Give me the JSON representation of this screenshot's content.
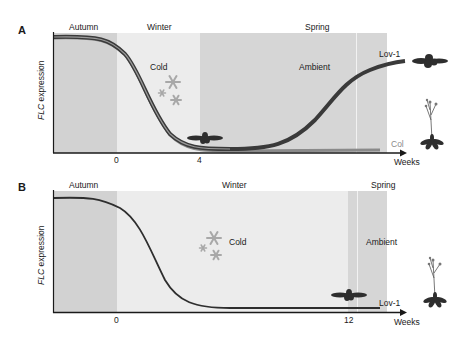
{
  "panels": [
    {
      "letter": "A",
      "ylabel_italic": "FLC",
      "ylabel_rest": " expression",
      "xlabel": "Weeks",
      "season_labels": {
        "autumn": "Autumn",
        "winter": "Winter",
        "spring": "Spring"
      },
      "condition_labels": {
        "cold": "Cold",
        "ambient": "Ambient"
      },
      "x_ticks": [
        "0",
        "4"
      ],
      "series_labels": {
        "lov1": "Lov-1",
        "col": "Col"
      }
    },
    {
      "letter": "B",
      "ylabel_italic": "FLC",
      "ylabel_rest": " expression",
      "xlabel": "Weeks",
      "season_labels": {
        "autumn": "Autumn",
        "winter": "Winter",
        "spring": "Spring"
      },
      "condition_labels": {
        "cold": "Cold",
        "ambient": "Ambient"
      },
      "x_ticks": [
        "0",
        "12"
      ],
      "series_labels": {
        "lov1": "Lov-1"
      }
    }
  ],
  "colors": {
    "autumn_shade": "#d2d2d2",
    "winter_shade": "#ececec",
    "spring_shade": "#d6d6d6",
    "curve": "#3a3a3a",
    "col_curve": "#8a8a8a",
    "snowflake": "#a8a8a8",
    "plant": "#2e2e2e"
  }
}
